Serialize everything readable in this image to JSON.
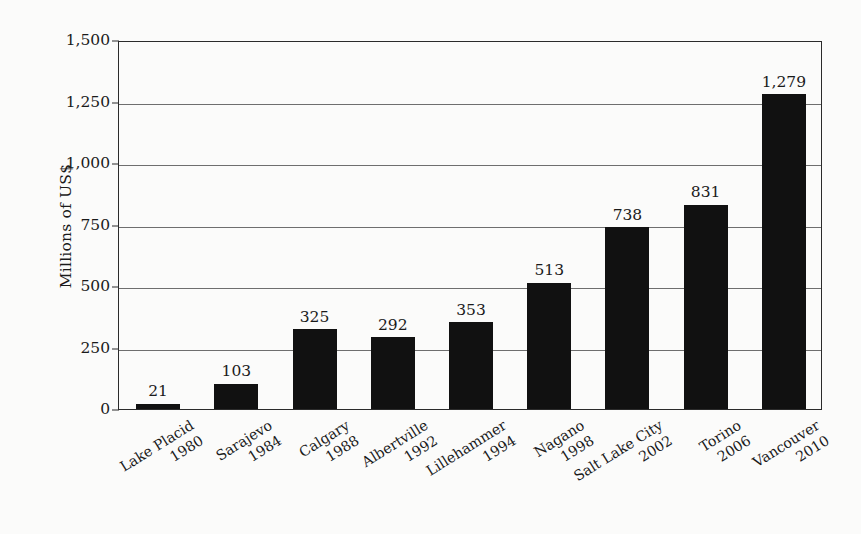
{
  "chart_data": {
    "type": "bar",
    "title": "",
    "subtitle": "",
    "xlabel": "",
    "ylabel": "Millions of US$",
    "ylim": [
      0,
      1500
    ],
    "ytick_values": [
      0,
      250,
      500,
      750,
      1000,
      1250,
      1500
    ],
    "ytick_labels": [
      "0",
      "250",
      "500",
      "750",
      "1,000",
      "1,250",
      "1,500"
    ],
    "grid": true,
    "legend": "none",
    "bar_color": "#111111",
    "categories": [
      "Lake Placid 1980",
      "Sarajevo 1984",
      "Calgary 1988",
      "Albertville 1992",
      "Lillehammer 1994",
      "Nagano 1998",
      "Salt Lake City 2002",
      "Torino 2006",
      "Vancouver 2010"
    ],
    "values": [
      21,
      103,
      325,
      292,
      353,
      513,
      738,
      831,
      1279
    ],
    "value_labels": [
      "21",
      "103",
      "325",
      "292",
      "353",
      "513",
      "738",
      "831",
      "1,279"
    ],
    "category_lines": [
      {
        "city": "Lake Placid",
        "year": "1980"
      },
      {
        "city": "Sarajevo",
        "year": "1984"
      },
      {
        "city": "Calgary",
        "year": "1988"
      },
      {
        "city": "Albertville",
        "year": "1992"
      },
      {
        "city": "Lillehammer",
        "year": "1994"
      },
      {
        "city": "Nagano",
        "year": "1998"
      },
      {
        "city": "Salt Lake City",
        "year": "2002"
      },
      {
        "city": "Torino",
        "year": "2006"
      },
      {
        "city": "Vancouver",
        "year": "2010"
      }
    ]
  }
}
